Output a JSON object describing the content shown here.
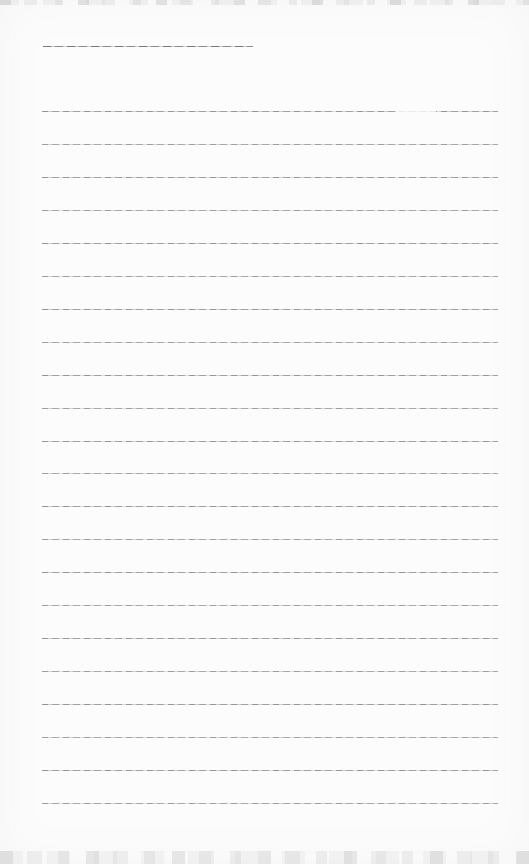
{
  "page": {
    "kind": "blank ruled notepad page (scanned, no text)",
    "background_color": "#fcfcfc",
    "line_color": "#9a9a9a",
    "title_line": {
      "x": 43,
      "y": 46,
      "width": 210
    },
    "ruled_lines": {
      "count": 22,
      "x": 42,
      "width": 456,
      "first_y": 111,
      "spacing": 32.95
    },
    "scan_artifacts": {
      "top_noise_height": 5,
      "bottom_noise_height": 13,
      "fade_spots": [
        {
          "x": 396,
          "y": 109,
          "width": 40,
          "height": 4
        }
      ]
    }
  }
}
